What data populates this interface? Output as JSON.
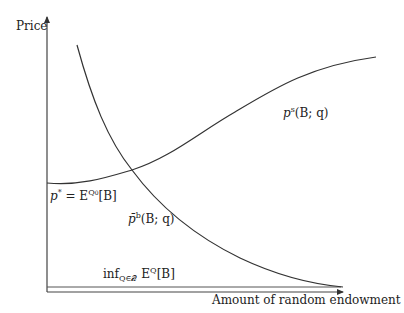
{
  "axes": {
    "y_label": "Price",
    "x_label": "Amount of random endowment"
  },
  "curves": {
    "seller": {
      "label_base": "p",
      "label_sup": "s",
      "label_args": "(B; q)"
    },
    "buyer": {
      "label_base": "p̄",
      "label_sup": "b",
      "label_args": "(B; q)"
    },
    "intercept": {
      "label_lhs": "p",
      "label_lhs_sup": "*",
      "label_eq": " = E",
      "label_sup": "Q",
      "label_sup_sub": "0",
      "label_args": "[B]"
    },
    "infimum": {
      "label_op": "inf",
      "label_sub": "Q∈𝒬",
      "label_E": " E",
      "label_sup": "Q",
      "label_args": "[B]"
    }
  },
  "colors": {
    "line": "#333333",
    "axis": "#444444",
    "text": "#222222",
    "background": "#ffffff"
  }
}
